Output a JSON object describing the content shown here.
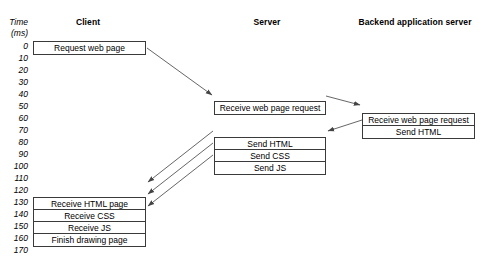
{
  "diagram": {
    "type": "sequence-timeline",
    "axis": {
      "caption_line1": "Time",
      "caption_line2": "(ms)",
      "ticks": [
        "0",
        "10",
        "20",
        "30",
        "40",
        "50",
        "60",
        "70",
        "80",
        "90",
        "100",
        "110",
        "120",
        "130",
        "140",
        "150",
        "160",
        "170"
      ],
      "tick_step_ms": 10,
      "min_ms": 0,
      "max_ms": 170
    },
    "lanes": [
      {
        "id": "client",
        "title": "Client"
      },
      {
        "id": "server",
        "title": "Server"
      },
      {
        "id": "backend",
        "title": "Backend application server"
      }
    ],
    "boxes": [
      {
        "id": "client-request",
        "lane": "client",
        "start_ms": 0,
        "rows": [
          "Request web page"
        ]
      },
      {
        "id": "server-receive",
        "lane": "server",
        "start_ms": 50,
        "rows": [
          "Receive web page request"
        ]
      },
      {
        "id": "backend-receive-send",
        "lane": "backend",
        "start_ms": 60,
        "rows": [
          "Receive web page request",
          "Send HTML"
        ]
      },
      {
        "id": "server-send",
        "lane": "server",
        "start_ms": 80,
        "rows": [
          "Send HTML",
          "Send CSS",
          "Send JS"
        ]
      },
      {
        "id": "client-receive",
        "lane": "client",
        "start_ms": 130,
        "rows": [
          "Receive HTML page",
          "Receive CSS",
          "Receive JS",
          "Finish drawing page"
        ]
      }
    ],
    "arrows": [
      {
        "id": "arrow-client-to-server",
        "from": "client-request",
        "to": "server-receive"
      },
      {
        "id": "arrow-server-to-backend",
        "from": "server-receive",
        "to": "backend-receive-send"
      },
      {
        "id": "arrow-backend-to-server",
        "from": "backend-receive-send",
        "to": "server-send"
      },
      {
        "id": "arrow-server-html-to-client",
        "from": "server-send",
        "to": "client-receive"
      },
      {
        "id": "arrow-server-css-to-client",
        "from": "server-send",
        "to": "client-receive"
      },
      {
        "id": "arrow-server-js-to-client",
        "from": "server-send",
        "to": "client-receive"
      }
    ],
    "colors": {
      "background": "#ffffff",
      "stroke": "#3a3a3a",
      "text": "#000000",
      "arrow": "#555555"
    }
  }
}
